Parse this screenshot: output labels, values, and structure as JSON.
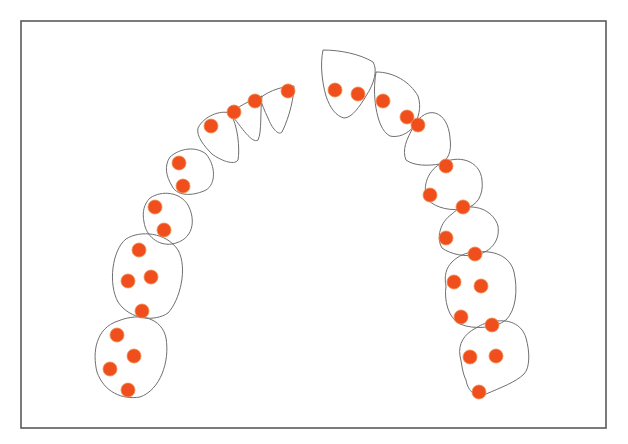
{
  "diagram": {
    "type": "dental-arch",
    "frame": {
      "x": 21,
      "y": 21,
      "width": 585,
      "height": 407
    },
    "colors": {
      "outline": "#6f6f6f",
      "frame": "#5a5a5a",
      "marker": "#f04e1c",
      "background": "#ffffff"
    },
    "marker_radius": 7,
    "teeth": [
      {
        "id": "left-molar-2",
        "path": "M118,321 C140,312 162,318 166,338 C170,362 160,390 140,397 C122,400 104,392 97,372 C92,352 96,328 118,321 Z"
      },
      {
        "id": "left-molar-1",
        "path": "M126,239 C140,230 166,232 178,250 C188,268 180,300 168,313 C155,322 130,320 118,302 C108,284 112,250 126,239 Z"
      },
      {
        "id": "left-premolar-2",
        "path": "M150,198 C162,190 180,192 188,205 C196,220 194,240 172,244 C158,246 146,236 144,222 C142,212 144,204 150,198 Z"
      },
      {
        "id": "left-premolar-1",
        "path": "M170,157 C180,148 196,146 206,154 C216,166 216,184 206,190 C196,195 178,198 172,186 C166,176 164,166 170,157 Z"
      },
      {
        "id": "left-canine",
        "path": "M198,128 C204,116 220,110 230,113 C238,124 240,150 238,160 C234,166 220,160 212,154 C204,146 196,136 198,128 Z"
      },
      {
        "id": "left-lateral-incisor",
        "path": "M230,113 C242,104 256,98 262,96 C260,112 262,132 258,140 C252,144 242,128 230,113 Z"
      },
      {
        "id": "left-central-incisor",
        "path": "M260,98 C270,90 284,86 294,86 C294,96 290,116 282,132 C278,136 272,128 268,118 C264,110 262,104 260,98 Z"
      },
      {
        "id": "right-central-incisor",
        "path": "M323,50 C340,50 360,54 373,62 C378,70 374,84 366,96 C360,106 352,118 344,118 C336,116 330,108 326,96 C322,82 320,64 323,50 Z"
      },
      {
        "id": "right-lateral-incisor",
        "path": "M376,72 C394,72 410,82 418,96 C422,108 418,118 414,126 C408,134 398,138 390,136 C382,132 378,120 376,108 C374,96 374,84 376,72 Z"
      },
      {
        "id": "right-canine",
        "path": "M414,126 C426,104 448,110 450,138 C452,152 448,160 440,164 C428,166 414,166 406,160 C402,150 406,140 414,126 Z"
      },
      {
        "id": "right-premolar-1",
        "path": "M440,164 C458,154 480,160 482,180 C484,196 476,206 466,208 C452,212 436,208 428,200 C422,190 426,172 440,164 Z"
      },
      {
        "id": "right-premolar-2",
        "path": "M462,208 C478,204 494,212 498,226 C500,240 492,250 480,254 C466,258 450,254 442,248 C436,238 440,222 452,214 C456,210 460,208 462,208 Z"
      },
      {
        "id": "right-molar-1",
        "path": "M476,252 C494,250 510,256 514,272 C518,290 516,310 506,320 C496,328 474,330 460,324 C448,318 444,300 446,286 C444,276 446,268 452,262 C458,256 466,252 476,252 Z"
      },
      {
        "id": "right-molar-2",
        "path": "M492,322 C508,318 522,324 526,338 C530,352 530,368 524,374 C516,382 500,388 486,394 C476,398 468,392 466,380 C462,372 462,364 460,356 C458,344 464,334 476,328 C482,324 488,322 492,322 Z"
      }
    ],
    "markers": [
      {
        "x": 288,
        "y": 91
      },
      {
        "x": 255,
        "y": 101
      },
      {
        "x": 234,
        "y": 112
      },
      {
        "x": 211,
        "y": 126
      },
      {
        "x": 179,
        "y": 163
      },
      {
        "x": 183,
        "y": 186
      },
      {
        "x": 155,
        "y": 207
      },
      {
        "x": 164,
        "y": 230
      },
      {
        "x": 139,
        "y": 250
      },
      {
        "x": 128,
        "y": 281
      },
      {
        "x": 151,
        "y": 277
      },
      {
        "x": 142,
        "y": 311
      },
      {
        "x": 117,
        "y": 335
      },
      {
        "x": 134,
        "y": 356
      },
      {
        "x": 110,
        "y": 369
      },
      {
        "x": 128,
        "y": 390
      },
      {
        "x": 335,
        "y": 90
      },
      {
        "x": 358,
        "y": 94
      },
      {
        "x": 383,
        "y": 101
      },
      {
        "x": 407,
        "y": 117
      },
      {
        "x": 418,
        "y": 125
      },
      {
        "x": 446,
        "y": 166
      },
      {
        "x": 430,
        "y": 195
      },
      {
        "x": 463,
        "y": 207
      },
      {
        "x": 446,
        "y": 238
      },
      {
        "x": 475,
        "y": 254
      },
      {
        "x": 454,
        "y": 282
      },
      {
        "x": 481,
        "y": 286
      },
      {
        "x": 461,
        "y": 317
      },
      {
        "x": 492,
        "y": 325
      },
      {
        "x": 470,
        "y": 357
      },
      {
        "x": 496,
        "y": 356
      },
      {
        "x": 479,
        "y": 392
      }
    ]
  }
}
